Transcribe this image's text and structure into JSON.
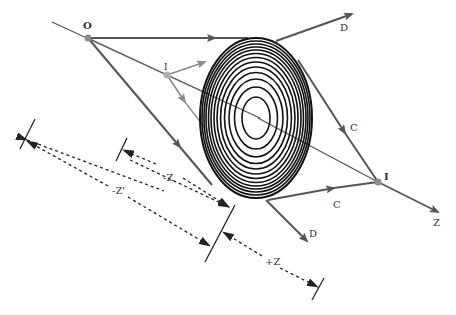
{
  "diagram": {
    "colors": {
      "ray": "#555555",
      "ray_light": "#8a8a8a",
      "lens": "#111111",
      "point": "#8c8c8c",
      "dimension": "#333333"
    },
    "labels": {
      "object_point": "O",
      "virtual_image": "I",
      "real_image": "I",
      "diverging_ray_top": "D",
      "diverging_ray_bottom": "D",
      "converging_ray_top": "C",
      "converging_ray_bottom": "C",
      "axis": "Z",
      "dim_neg_z": "-Z",
      "dim_neg_z_prime": "-Z'",
      "dim_pos_z": "+Z"
    }
  }
}
